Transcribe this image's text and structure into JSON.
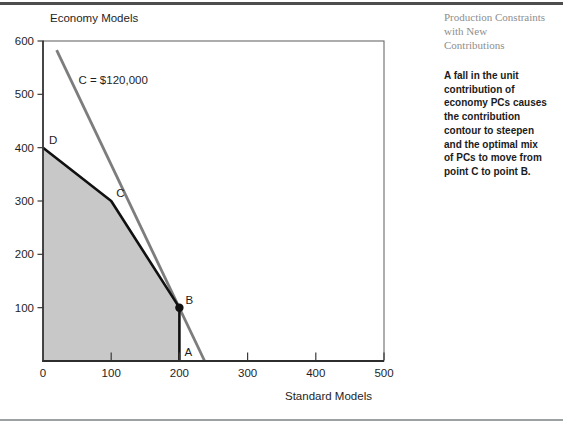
{
  "sidebar": {
    "title_lines": [
      "Production Constraints",
      "with New",
      "Contributions"
    ],
    "body_lines": [
      "A fall in the unit",
      "contribution of",
      "economy PCs causes",
      "the contribution",
      "contour to steepen",
      "and the optimal mix",
      "of PCs to move from",
      "point C to point B."
    ]
  },
  "colors": {
    "feasible_fill": "#c8c8c8",
    "boundary": "#111111",
    "contour": "#7d7d7d",
    "axis": "#2d2d2d",
    "plot_border": "#6a6a6a",
    "top_rule": "#4d4d4d",
    "bottom_rule": "#9ca1a4"
  },
  "chart_data": {
    "type": "line",
    "title": "",
    "xlabel": "Standard Models",
    "ylabel": "Economy Models",
    "xlim": [
      0,
      500
    ],
    "ylim": [
      0,
      600
    ],
    "x_ticks": [
      0,
      100,
      200,
      300,
      400,
      500
    ],
    "y_ticks": [
      100,
      200,
      300,
      400,
      500,
      600
    ],
    "grid": false,
    "legend": "none",
    "feasible_region": {
      "vertices": [
        [
          0,
          0
        ],
        [
          0,
          400
        ],
        [
          100,
          300
        ],
        [
          200,
          100
        ],
        [
          200,
          0
        ]
      ],
      "fill_color": "#c8c8c8"
    },
    "boundary_line": {
      "points": [
        [
          0,
          400
        ],
        [
          100,
          300
        ],
        [
          200,
          100
        ],
        [
          200,
          0
        ]
      ],
      "color": "#111111"
    },
    "contour_line": {
      "label": "C = $120,000",
      "from": [
        20,
        583
      ],
      "to": [
        237,
        0
      ],
      "label_pos": [
        52,
        520
      ],
      "color": "#7d7d7d"
    },
    "optimal_point": {
      "label": "B",
      "x": 200,
      "y": 100
    },
    "point_labels": [
      {
        "text": "D",
        "x": 0,
        "y": 400,
        "dx": 6,
        "dy": -4
      },
      {
        "text": "C",
        "x": 100,
        "y": 300,
        "dx": 5,
        "dy": -4
      },
      {
        "text": "B",
        "x": 200,
        "y": 100,
        "dx": 6,
        "dy": -4
      },
      {
        "text": "A",
        "x": 200,
        "y": 0,
        "dx": 5,
        "dy": -5
      }
    ]
  }
}
